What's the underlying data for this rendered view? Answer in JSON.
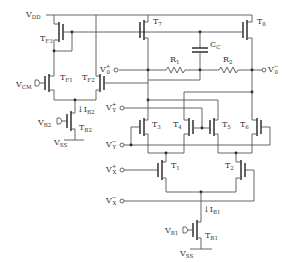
{
  "diagram": {
    "type": "circuit-schematic",
    "title": "",
    "supplies": {
      "vdd": {
        "main": "V",
        "sub": "DD"
      },
      "vss_top": {
        "main": "V",
        "sub": "SS"
      },
      "vss_bottom": {
        "main": "V",
        "sub": "SS"
      }
    },
    "inputs": {
      "vcm": {
        "main": "V",
        "sub": "CM"
      },
      "vb2": {
        "main": "V",
        "sub": "B2"
      },
      "vb1": {
        "main": "V",
        "sub": "B1"
      },
      "vy_plus": {
        "main": "V",
        "sup": "+",
        "sub": "Y"
      },
      "vy_minus": {
        "main": "V",
        "sup": "−",
        "sub": "Y"
      },
      "vx_plus": {
        "main": "V",
        "sup": "+",
        "sub": "X"
      },
      "vx_minus": {
        "main": "V",
        "sup": "−",
        "sub": "X"
      }
    },
    "outputs": {
      "vo_plus": {
        "main": "V",
        "sup": "+",
        "sub": "0"
      },
      "vo_minus": {
        "main": "V",
        "sup": "−",
        "sub": "0"
      }
    },
    "transistors": [
      {
        "id": "TF3",
        "main": "T",
        "sub": "F3"
      },
      {
        "id": "TF1",
        "main": "T",
        "sub": "F1"
      },
      {
        "id": "TF2",
        "main": "T",
        "sub": "F2"
      },
      {
        "id": "TB2",
        "main": "T",
        "sub": "B2"
      },
      {
        "id": "T7",
        "main": "T",
        "sub": "7"
      },
      {
        "id": "T8",
        "main": "T",
        "sub": "8"
      },
      {
        "id": "T3",
        "main": "T",
        "sub": "3"
      },
      {
        "id": "T4",
        "main": "T",
        "sub": "4"
      },
      {
        "id": "T5",
        "main": "T",
        "sub": "5"
      },
      {
        "id": "T6",
        "main": "T",
        "sub": "6"
      },
      {
        "id": "T1",
        "main": "T",
        "sub": "1"
      },
      {
        "id": "T2",
        "main": "T",
        "sub": "2"
      },
      {
        "id": "TB1",
        "main": "T",
        "sub": "B1"
      }
    ],
    "passives": {
      "r1": {
        "main": "R",
        "sub": "1"
      },
      "r2": {
        "main": "R",
        "sub": "2"
      },
      "cc": {
        "main": "C",
        "sub": "C"
      }
    },
    "currents": {
      "ib2": {
        "main": "I",
        "sub": "B2"
      },
      "ib1": {
        "main": "I",
        "sub": "B1"
      }
    }
  }
}
